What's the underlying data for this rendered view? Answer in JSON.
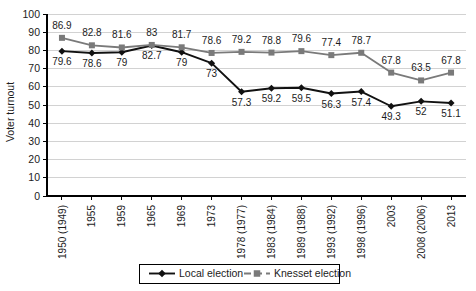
{
  "chart_data": {
    "type": "line",
    "title": "",
    "xlabel": "",
    "ylabel": "Voter turnout",
    "ylim": [
      0,
      100
    ],
    "ytick_step": 10,
    "yticks": [
      100,
      90,
      80,
      70,
      60,
      50,
      40,
      30,
      20,
      10,
      0
    ],
    "grid": true,
    "legend_position": "bottom",
    "categories": [
      "1950 (1949)",
      "1955",
      "1959",
      "1965",
      "1969",
      "1973",
      "1978 (1977)",
      "1983 (1984)",
      "1989 (1988)",
      "1993 (1992)",
      "1998 (1996)",
      "2003",
      "2008 (2006)",
      "2013"
    ],
    "series": [
      {
        "name": "Local election",
        "marker": "diamond",
        "color": "#111111",
        "line_style": "solid",
        "values": [
          79.6,
          78.6,
          79,
          82.7,
          79,
          73,
          57.3,
          59.2,
          59.5,
          56.3,
          57.4,
          49.3,
          52,
          51.1
        ],
        "label_positions": [
          "below",
          "below",
          "below",
          "below",
          "below",
          "below",
          "below",
          "below",
          "below",
          "below",
          "below",
          "below",
          "below",
          "below"
        ]
      },
      {
        "name": "Knesset election",
        "marker": "square",
        "color": "#7a7a7a",
        "line_style": "solid",
        "values": [
          86.9,
          82.8,
          81.6,
          83,
          81.7,
          78.6,
          79.2,
          78.8,
          79.6,
          77.4,
          78.7,
          67.8,
          63.5,
          67.8
        ],
        "label_positions": [
          "above",
          "above",
          "above",
          "above",
          "above",
          "above",
          "above",
          "above",
          "above",
          "above",
          "above",
          "above",
          "above",
          "above"
        ]
      }
    ]
  },
  "legend": {
    "items": [
      {
        "label": "Local election",
        "marker": "diamond-icon",
        "color": "#111111"
      },
      {
        "label": "Knesset election",
        "marker": "square-icon",
        "color": "#7a7a7a"
      }
    ]
  },
  "axes": {
    "y_title": "Voter turnout"
  }
}
